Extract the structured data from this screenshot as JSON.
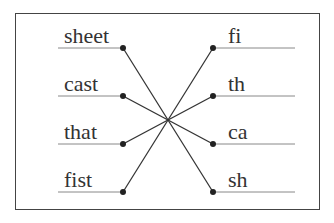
{
  "diagram": {
    "type": "matching-exercise",
    "left_words": [
      "sheet",
      "cast",
      "that",
      "fist"
    ],
    "right_words": [
      "fi",
      "th",
      "ca",
      "sh"
    ],
    "connections": [
      {
        "from": "sheet",
        "to": "sh"
      },
      {
        "from": "cast",
        "to": "ca"
      },
      {
        "from": "that",
        "to": "th"
      },
      {
        "from": "fist",
        "to": "fi"
      }
    ],
    "colors": {
      "line": "#333333",
      "underline": "#888888",
      "border": "#444444",
      "text": "#333333"
    }
  }
}
